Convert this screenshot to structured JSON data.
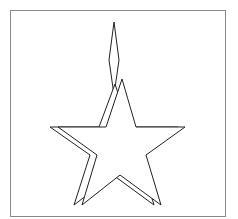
{
  "figure": {
    "colors": {
      "background": "#ffffff",
      "frame": "#8a8a8a",
      "stroke": "#222222",
      "fill": "#ffffff"
    },
    "shapes": [
      {
        "name": "back-star",
        "kind": "star"
      },
      {
        "name": "diamond",
        "kind": "diamond"
      },
      {
        "name": "front-star",
        "kind": "star"
      }
    ]
  }
}
